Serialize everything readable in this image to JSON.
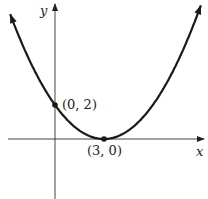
{
  "chart_data": {
    "type": "line",
    "title": "",
    "xlabel": "x",
    "ylabel": "y",
    "function": "y = (2/9)(x - 3)^2",
    "series": [
      {
        "name": "parabola",
        "x": [
          -2.7,
          -1,
          0,
          1,
          2,
          3,
          4,
          5,
          6,
          7,
          8.9
        ],
        "y": [
          7.2,
          3.56,
          2,
          0.89,
          0.22,
          0,
          0.22,
          0.89,
          2,
          3.56,
          7.7
        ]
      }
    ],
    "points": [
      {
        "label": "(0, 2)",
        "x": 0,
        "y": 2
      },
      {
        "label": "(3, 0)",
        "x": 3,
        "y": 0
      }
    ],
    "grid": false,
    "axes_arrows": true
  },
  "labels": {
    "x_axis": "x",
    "y_axis": "y",
    "point_a": "(0, 2)",
    "point_b": "(3, 0)"
  },
  "colors": {
    "curve": "#1a1a1a",
    "axis": "#333333"
  }
}
